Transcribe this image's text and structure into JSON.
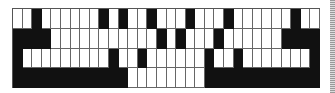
{
  "pattern": {
    "columns": 32,
    "rows": 4,
    "on_color": "#111111",
    "off_color": "#ffffff",
    "grid": [
      [
        0,
        0,
        1,
        0,
        0,
        0,
        0,
        0,
        0,
        1,
        0,
        1,
        0,
        0,
        1,
        0,
        0,
        0,
        1,
        0,
        0,
        0,
        1,
        0,
        0,
        0,
        0,
        0,
        0,
        1,
        0,
        0
      ],
      [
        1,
        1,
        1,
        1,
        0,
        0,
        0,
        0,
        0,
        0,
        0,
        0,
        0,
        0,
        0,
        1,
        0,
        1,
        0,
        0,
        0,
        1,
        0,
        0,
        0,
        0,
        0,
        0,
        1,
        1,
        1,
        1
      ],
      [
        1,
        0,
        0,
        0,
        0,
        0,
        0,
        0,
        0,
        0,
        1,
        0,
        0,
        1,
        0,
        0,
        0,
        0,
        0,
        0,
        1,
        0,
        0,
        1,
        0,
        0,
        0,
        0,
        0,
        0,
        0,
        1
      ],
      [
        1,
        1,
        1,
        1,
        1,
        1,
        1,
        1,
        1,
        1,
        1,
        1,
        0,
        0,
        0,
        0,
        0,
        0,
        0,
        0,
        1,
        1,
        1,
        1,
        1,
        1,
        1,
        1,
        1,
        1,
        1,
        1
      ]
    ]
  }
}
